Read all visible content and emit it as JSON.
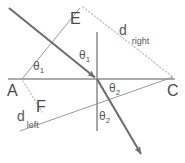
{
  "figure": {
    "background_color": "#ffffff",
    "stroke_color": "#6e6e70",
    "thin_stroke_color": "#8a8a8c",
    "dotted_stroke_color": "#b9b9bb",
    "label_color": "#58585a",
    "width": 185,
    "height": 163
  },
  "points": {
    "A": "A",
    "C": "C",
    "E": "E",
    "F": "F"
  },
  "distances": {
    "right_base": "d",
    "right_sub": "right",
    "left_base": "d",
    "left_sub": "left"
  },
  "angles": {
    "incident_at_A": "θ",
    "incident_at_A_sub": "1",
    "incident_at_normal": "θ",
    "incident_at_normal_sub": "1",
    "refracted_upper": "θ",
    "refracted_upper_sub": "2",
    "refracted_lower": "θ",
    "refracted_lower_sub": "2"
  },
  "geometry": {
    "origin_x": 97,
    "origin_y": 79,
    "interface_y": 79,
    "interface_x_start": 8,
    "interface_x_end": 175,
    "normal_x": 97,
    "normal_y_top": 32,
    "normal_y_bottom": 131,
    "incident_ray_start": [
      9,
      9
    ],
    "incident_ray_end": [
      97,
      79
    ],
    "refracted_ray_end": [
      144,
      158
    ],
    "A_vertex": [
      22,
      79
    ],
    "E_vertex": [
      79,
      9
    ],
    "C_vertex": [
      172,
      79
    ],
    "F_vertex": [
      25,
      126
    ]
  }
}
